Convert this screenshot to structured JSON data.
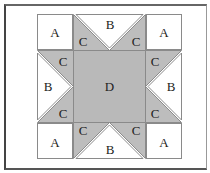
{
  "diagram": {
    "colors": {
      "background": "#ffffff",
      "shaded": "#bdbdbd",
      "center": "#b9b9b9",
      "stroke": "#8a8a8a",
      "frame": "#555555"
    },
    "pieces": {
      "corners": [
        {
          "position": "top-left",
          "label": "A"
        },
        {
          "position": "top-right",
          "label": "A"
        },
        {
          "position": "bottom-left",
          "label": "A"
        },
        {
          "position": "bottom-right",
          "label": "A"
        }
      ],
      "geese": [
        {
          "position": "top",
          "big": "B",
          "small_1": "C",
          "small_2": "C"
        },
        {
          "position": "left",
          "big": "B",
          "small_1": "C",
          "small_2": "C"
        },
        {
          "position": "right",
          "big": "B",
          "small_1": "C",
          "small_2": "C"
        },
        {
          "position": "bottom",
          "big": "B",
          "small_1": "C",
          "small_2": "C"
        }
      ],
      "center": {
        "label": "D"
      }
    }
  }
}
